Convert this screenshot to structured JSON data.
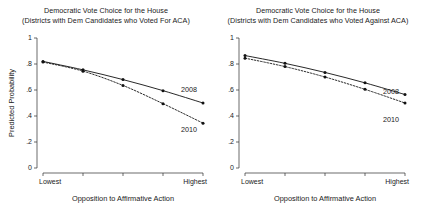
{
  "figure": {
    "width": 424,
    "height": 212,
    "background": "#ffffff",
    "ink_color": "#111111"
  },
  "panels": {
    "left": {
      "title_line1": "Democratic Vote Choice for the House",
      "title_line2": "(Districts with Dem Candidates who Voted For ACA)",
      "ylabel": "Predicted Probability",
      "xlabel": "Opposition to Affirmative Action",
      "ytick_labels": [
        "0",
        ".2",
        ".4",
        ".6",
        ".8",
        "1"
      ],
      "xtick_labels": [
        "Lowest",
        "",
        "",
        "",
        "Highest"
      ],
      "series_labels": {
        "solid": "2008",
        "dashed": "2010"
      }
    },
    "right": {
      "title_line1": "Democratic Vote Choice for the House",
      "title_line2": "(Districts with Dem Candidates who Voted Against ACA)",
      "ylabel": "",
      "xlabel": "Opposition to Affirmative Action",
      "ytick_labels": [
        "0",
        ".2",
        ".4",
        ".6",
        ".8",
        "1"
      ],
      "xtick_labels": [
        "Lowest",
        "",
        "",
        "",
        "Highest"
      ],
      "series_labels": {
        "solid": "2008",
        "dashed": "2010"
      }
    }
  },
  "chart_data": [
    {
      "type": "line",
      "panel": "left",
      "title": "Democratic Vote Choice for the House (Districts with Dem Candidates who Voted For ACA)",
      "xlabel": "Opposition to Affirmative Action",
      "ylabel": "Predicted Probability",
      "x": [
        1,
        2,
        3,
        4,
        5
      ],
      "xtick_labels": [
        "Lowest",
        "",
        "",
        "",
        "Highest"
      ],
      "ytick_values": [
        0,
        0.2,
        0.4,
        0.6,
        0.8,
        1
      ],
      "ytick_labels": [
        "0",
        ".2",
        ".4",
        ".6",
        ".8",
        "1"
      ],
      "ylim": [
        0,
        1
      ],
      "grid": false,
      "legend": "inline-right",
      "series": [
        {
          "name": "2008",
          "style": "solid",
          "markers": true,
          "values": [
            0.82,
            0.755,
            0.68,
            0.595,
            0.5
          ]
        },
        {
          "name": "2010",
          "style": "dashed",
          "markers": true,
          "values": [
            0.815,
            0.745,
            0.635,
            0.495,
            0.345
          ]
        }
      ]
    },
    {
      "type": "line",
      "panel": "right",
      "title": "Democratic Vote Choice for the House (Districts with Dem Candidates who Voted Against ACA)",
      "xlabel": "Opposition to Affirmative Action",
      "ylabel": "",
      "x": [
        1,
        2,
        3,
        4,
        5
      ],
      "xtick_labels": [
        "Lowest",
        "",
        "",
        "",
        "Highest"
      ],
      "ytick_values": [
        0,
        0.2,
        0.4,
        0.6,
        0.8,
        1
      ],
      "ytick_labels": [
        "0",
        ".2",
        ".4",
        ".6",
        ".8",
        "1"
      ],
      "ylim": [
        0,
        1
      ],
      "grid": false,
      "legend": "inline-right",
      "series": [
        {
          "name": "2008",
          "style": "solid",
          "markers": true,
          "values": [
            0.865,
            0.805,
            0.735,
            0.655,
            0.565
          ]
        },
        {
          "name": "2010",
          "style": "dashed",
          "markers": true,
          "values": [
            0.845,
            0.78,
            0.7,
            0.605,
            0.5
          ]
        }
      ]
    }
  ]
}
